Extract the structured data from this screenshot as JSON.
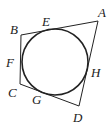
{
  "figure": {
    "type": "quadrilateral-with-inscribed-circle",
    "stroke_color": "#222222",
    "background": "#ffffff"
  },
  "vertices": {
    "A": {
      "label": "A",
      "x": 98,
      "y": 21,
      "label_x": 98,
      "label_y": 17
    },
    "B": {
      "label": "B",
      "x": 21,
      "y": 35,
      "label_x": 10,
      "label_y": 34
    },
    "C": {
      "label": "C",
      "x": 20,
      "y": 84,
      "label_x": 8,
      "label_y": 97
    },
    "D": {
      "label": "D",
      "x": 79,
      "y": 106,
      "label_x": 73,
      "label_y": 122
    }
  },
  "circle": {
    "cx": 55,
    "cy": 62,
    "r": 33
  },
  "tangent_points": {
    "E": {
      "label": "E",
      "label_x": 42,
      "label_y": 26
    },
    "F": {
      "label": "F",
      "label_x": 6,
      "label_y": 67
    },
    "G": {
      "label": "G",
      "label_x": 32,
      "label_y": 104
    },
    "H": {
      "label": "H",
      "label_x": 91,
      "label_y": 77
    }
  }
}
